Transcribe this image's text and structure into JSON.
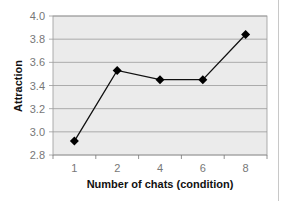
{
  "chart_data": {
    "type": "line",
    "title": "",
    "xlabel": "Number of chats (condition)",
    "ylabel": "Attraction",
    "categories": [
      "1",
      "2",
      "4",
      "6",
      "8"
    ],
    "series": [
      {
        "name": "Attraction",
        "values": [
          2.92,
          3.53,
          3.45,
          3.45,
          3.84
        ],
        "marker": "diamond",
        "color": "#000000"
      }
    ],
    "yticks": [
      "2.8",
      "3.0",
      "3.2",
      "3.4",
      "3.6",
      "3.8",
      "4.0"
    ],
    "ylim": [
      2.8,
      4.0
    ],
    "grid": true,
    "legend": "none",
    "plot_background": "#ebebeb"
  }
}
